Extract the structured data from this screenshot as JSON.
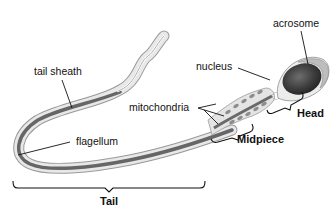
{
  "diagram": {
    "labels": {
      "tail_sheath": "tail sheath",
      "flagellum": "flagellum",
      "mitochondria": "mitochondria",
      "nucleus": "nucleus",
      "acrosome": "acrosome"
    },
    "regions": {
      "tail": "Tail",
      "midpiece": "Midpiece",
      "head": "Head"
    },
    "colors": {
      "background": "#ffffff",
      "sheath": "#e4e4e4",
      "core": "#6a6a6a",
      "nucleus": "#3a3a3a",
      "mitochondria": "#8c8c8c",
      "outline": "#888888",
      "text": "#111111"
    }
  }
}
